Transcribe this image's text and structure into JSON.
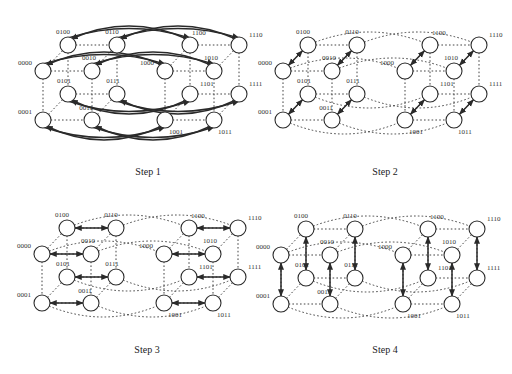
{
  "figure": {
    "colors": {
      "node_stroke": "#2a2a2a",
      "link": "#444444",
      "comm_arrow": "#2a2a2a",
      "text": "#333333"
    },
    "node_radius": 8,
    "node_labels": [
      "0000",
      "0001",
      "0010",
      "0011",
      "0100",
      "0101",
      "0110",
      "0111",
      "1000",
      "1001",
      "1010",
      "1011",
      "1100",
      "1101",
      "1110",
      "1111"
    ],
    "panels": [
      {
        "id": "step1",
        "caption": "Step 1",
        "caption_pos": [
          148,
          175
        ],
        "origin": [
          0,
          0
        ],
        "comm_dimension": "bit 3 (0xxx <-> 1xxx)",
        "arrow_style": "curved-one-way"
      },
      {
        "id": "step2",
        "caption": "Step 2",
        "caption_pos": [
          385,
          175
        ],
        "origin": [
          240,
          0
        ],
        "comm_dimension": "bit 2 (x0xx <-> x1xx)",
        "arrow_style": "diagonal-one-way"
      },
      {
        "id": "step3",
        "caption": "Step 3",
        "caption_pos": [
          147,
          353
        ],
        "origin": [
          -1,
          183
        ],
        "comm_dimension": "bit 1 (xx0x <-> xx1x)",
        "arrow_style": "horizontal-two-way"
      },
      {
        "id": "step4",
        "caption": "Step 4",
        "caption_pos": [
          385,
          353
        ],
        "origin": [
          238,
          184
        ],
        "comm_dimension": "bit 0 (xxx0 <-> xxx1)",
        "arrow_style": "vertical-two-way"
      }
    ],
    "bottom_caption": "Figure ... (caption cut off)"
  }
}
